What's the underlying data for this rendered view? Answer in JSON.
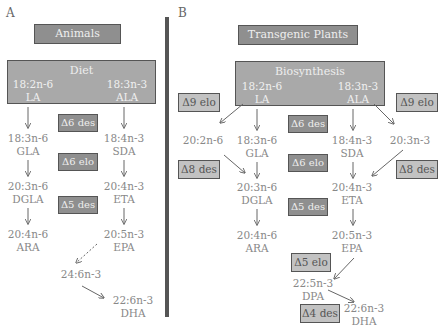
{
  "panel_a": {
    "letter": "A",
    "header": "Animals",
    "source_box": "Diet",
    "start": [
      {
        "formula": "18:2n-6",
        "name": "LA"
      },
      {
        "formula": "18:3n-3",
        "name": "ALA"
      }
    ],
    "n6": [
      {
        "formula": "18:3n-6",
        "name": "GLA"
      },
      {
        "formula": "20:3n-6",
        "name": "DGLA"
      },
      {
        "formula": "20:4n-6",
        "name": "ARA"
      }
    ],
    "n3": [
      {
        "formula": "18:4n-3",
        "name": "SDA"
      },
      {
        "formula": "20:4n-3",
        "name": "ETA"
      },
      {
        "formula": "20:5n-3",
        "name": "EPA"
      },
      {
        "formula": "24:6n-3",
        "name": ""
      },
      {
        "formula": "22:6n-3",
        "name": "DHA"
      }
    ],
    "enzymes": [
      "Δ6 des",
      "Δ6 elo",
      "Δ5 des"
    ]
  },
  "panel_b": {
    "letter": "B",
    "header": "Transgenic Plants",
    "source_box": "Biosynthesis",
    "start": [
      {
        "formula": "18:2n-6",
        "name": "LA"
      },
      {
        "formula": "18:3n-3",
        "name": "ALA"
      }
    ],
    "side_left": {
      "formula": "20:2n-6",
      "name": ""
    },
    "side_right": {
      "formula": "20:3n-3",
      "name": ""
    },
    "n6": [
      {
        "formula": "18:3n-6",
        "name": "GLA"
      },
      {
        "formula": "20:3n-6",
        "name": "DGLA"
      },
      {
        "formula": "20:4n-6",
        "name": "ARA"
      }
    ],
    "n3": [
      {
        "formula": "18:4n-3",
        "name": "SDA"
      },
      {
        "formula": "20:4n-3",
        "name": "ETA"
      },
      {
        "formula": "20:5n-3",
        "name": "EPA"
      },
      {
        "formula": "22:5n-3",
        "name": "DPA"
      },
      {
        "formula": "22:6n-3",
        "name": "DHA"
      }
    ],
    "enzymes_dark": [
      "Δ6 des",
      "Δ6 elo",
      "Δ5 des"
    ],
    "enzymes_light": [
      "Δ9 elo",
      "Δ9 elo",
      "Δ8 des",
      "Δ8 des",
      "Δ5 elo",
      "Δ4 des"
    ]
  },
  "colors": {
    "dark_box": "#8f8f8f",
    "light_box": "#c2c2c2",
    "big_box": "#a9a9a9",
    "divider": "#555555"
  }
}
